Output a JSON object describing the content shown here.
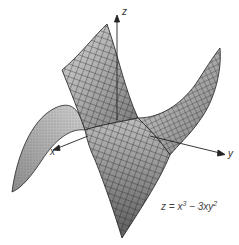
{
  "figure": {
    "type": "3d-surface",
    "equation": {
      "lhs": "z",
      "eq": "=",
      "term1": "x",
      "term1_exp": "3",
      "op": "−",
      "term2": "3xy",
      "term2_exp": "2"
    },
    "axes": {
      "x": "x",
      "y": "y",
      "z": "z"
    },
    "colors": {
      "surface_light": "#e8e8e8",
      "surface_dark": "#6a6a6a",
      "mesh": "#222222",
      "axis": "#222222"
    }
  }
}
